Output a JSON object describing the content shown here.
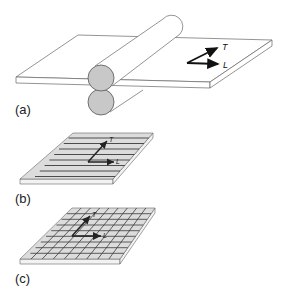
{
  "panels": [
    {
      "id": "a",
      "label": "(a)",
      "description": "Sheet passing between two rolls",
      "axes": {
        "transverse": "T",
        "longitudinal": "L"
      }
    },
    {
      "id": "b",
      "label": "(b)",
      "description": "Plate with longitudinal stripes",
      "axes": {
        "transverse": "T",
        "longitudinal": "L"
      }
    },
    {
      "id": "c",
      "label": "(c)",
      "description": "Plate with grid pattern",
      "axes": {
        "transverse": "T",
        "longitudinal": "L"
      }
    }
  ],
  "colors": {
    "outline": "#555555",
    "roll_fill": "#c8c8c8",
    "plate_fill": "#dcdcdc",
    "stripe": "#3a3a3a",
    "arrow": "#111111"
  }
}
